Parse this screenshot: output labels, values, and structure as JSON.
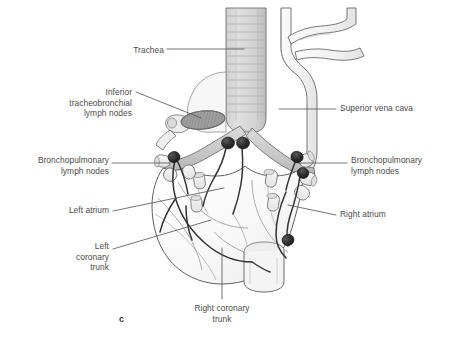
{
  "figure": {
    "letter": "c",
    "caption_labels": [
      {
        "id": "trachea",
        "text": "Trachea",
        "align": "right",
        "x": 104,
        "y": 45,
        "width": 60
      },
      {
        "id": "inferior-tracheobronchial-lymph-nodes",
        "text": "Inferior\ntracheobronchial\nlymph nodes",
        "align": "right",
        "x": 49,
        "y": 87,
        "width": 83
      },
      {
        "id": "bronchopulmonary-lymph-nodes-left",
        "text": "Bronchopulmonary\nlymph nodes",
        "align": "right",
        "x": 18,
        "y": 155,
        "width": 91
      },
      {
        "id": "left-atrium",
        "text": "Left atrium",
        "align": "right",
        "x": 50,
        "y": 205,
        "width": 59
      },
      {
        "id": "left-coronary-trunk",
        "text": "Left\ncoronary\ntrunk",
        "align": "right",
        "x": 59,
        "y": 241,
        "width": 50
      },
      {
        "id": "superior-vena-cava",
        "text": "Superior vena cava",
        "align": "left",
        "x": 340,
        "y": 103,
        "width": 110
      },
      {
        "id": "bronchopulmonary-lymph-nodes-right",
        "text": "Bronchopulmonary\nlymph nodes",
        "align": "left",
        "x": 351,
        "y": 155,
        "width": 98
      },
      {
        "id": "right-atrium",
        "text": "Right atrium",
        "align": "left",
        "x": 340,
        "y": 209,
        "width": 70
      },
      {
        "id": "right-coronary-trunk",
        "text": "Right coronary\ntrunk",
        "align": "center",
        "x": 174,
        "y": 303,
        "width": 96
      }
    ],
    "colors": {
      "label_text": "#4b4b4b",
      "leader_line": "#5a5a5a",
      "outline": "#5f5f5f",
      "trachea_fill": "#d7d7d7",
      "bronchus_fill": "#c9c9c9",
      "heart_fill": "#fafafa",
      "vessel_fill": "#f2f2f2",
      "lymph_node": "#2d2d2d",
      "lymph_vessel": "#3a3a3a",
      "cut_surface": "#9a9a9a",
      "background": "#ffffff"
    },
    "structures": [
      "trachea",
      "inferior tracheobronchial lymph nodes",
      "bronchopulmonary lymph nodes",
      "superior vena cava",
      "left atrium",
      "right atrium",
      "left coronary trunk",
      "right coronary trunk",
      "main bronchi",
      "pulmonary veins",
      "lymphatic vessels"
    ]
  }
}
